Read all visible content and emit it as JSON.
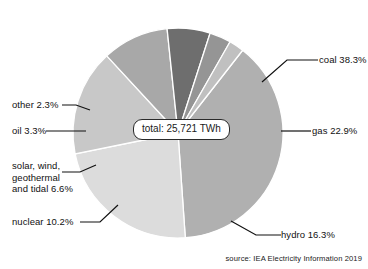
{
  "top_crop_text": "",
  "callout": {
    "text": "total: 25,721 TWh"
  },
  "source": {
    "text": "source: IEA Electricity Information 2019"
  },
  "labels": {
    "coal": "coal 38.3%",
    "gas": "gas 22.9%",
    "hydro": "hydro 16.3%",
    "nuclear": "nuclear 10.2%",
    "solar_line1": "solar, wind,",
    "solar_line2": "geothermal",
    "solar_line3": "and tidal 6.6%",
    "oil": "oil 3.3%",
    "other": "other 2.3%"
  },
  "chart_data": {
    "type": "pie",
    "title": "",
    "total_label": "total: 25,721 TWh",
    "total_value": 25721,
    "total_unit": "TWh",
    "source": "source: IEA Electricity Information 2019",
    "legend_position": "external-callout-labels",
    "start_angle_deg": -52,
    "direction": "clockwise",
    "units": "percent",
    "categories": [
      "coal",
      "gas",
      "hydro",
      "nuclear",
      "solar, wind, geothermal and tidal",
      "oil",
      "other"
    ],
    "values": [
      38.3,
      22.9,
      16.3,
      10.2,
      6.6,
      3.3,
      2.3
    ],
    "labels": [
      "coal 38.3%",
      "gas 22.9%",
      "hydro 16.3%",
      "nuclear 10.2%",
      "solar, wind, geothermal and tidal 6.6%",
      "oil 3.3%",
      "other 2.3%"
    ],
    "colors": [
      "#b0b0b0",
      "#dcdcdc",
      "#c8c8c8",
      "#a8a8a8",
      "#6e6e6e",
      "#959595",
      "#c0c0c0"
    ],
    "slice_separator_color": "#ffffff",
    "twh_values": [
      9851,
      5890,
      4192,
      2623,
      1698,
      849,
      592
    ]
  },
  "geometry": {
    "cx": 178,
    "cy": 133,
    "r": 105
  }
}
